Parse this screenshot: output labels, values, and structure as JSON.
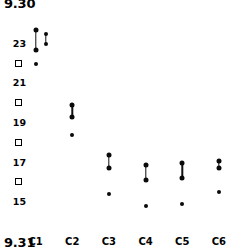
{
  "figure": {
    "caption_top": "9.30",
    "caption_bottom": "9.31",
    "background_color": "#ffffff",
    "marker_color": "#0a0a0a"
  },
  "chart_data": {
    "type": "scatter",
    "title": "",
    "subtitle": "",
    "xlabel": "",
    "ylabel": "",
    "grid": false,
    "legend": "none",
    "categories": [
      "C1",
      "C2",
      "C3",
      "C4",
      "C5",
      "C6"
    ],
    "ytick_labels": [
      "23",
      "21",
      "19",
      "17",
      "15"
    ],
    "ytick_values": [
      23,
      21,
      19,
      17,
      15
    ],
    "yminor_tick_values": [
      22,
      20,
      18,
      16
    ],
    "yminor_marker": "open-square",
    "ylim": [
      14.2,
      24.3
    ],
    "series": [
      {
        "name": "range-high",
        "values": [
          23.7,
          19.9,
          17.4,
          16.9,
          17.0,
          17.1
        ]
      },
      {
        "name": "range-low",
        "values": [
          22.7,
          19.3,
          16.7,
          16.1,
          16.2,
          16.7
        ]
      },
      {
        "name": "single-point",
        "values": [
          22.0,
          18.4,
          15.4,
          14.8,
          14.9,
          15.5
        ]
      }
    ],
    "extra_group": {
      "category": "C1",
      "x_offset_px": 10,
      "range_high": 23.5,
      "range_low": 23.0
    }
  },
  "axes": {
    "y_labels": [
      {
        "text": "23",
        "value": 23
      },
      {
        "text": "21",
        "value": 21
      },
      {
        "text": "19",
        "value": 19
      },
      {
        "text": "17",
        "value": 17
      },
      {
        "text": "15",
        "value": 15
      }
    ],
    "x_labels": [
      {
        "text": "C1"
      },
      {
        "text": "C2"
      },
      {
        "text": "C3"
      },
      {
        "text": "C4"
      },
      {
        "text": "C5"
      },
      {
        "text": "C6"
      }
    ]
  }
}
